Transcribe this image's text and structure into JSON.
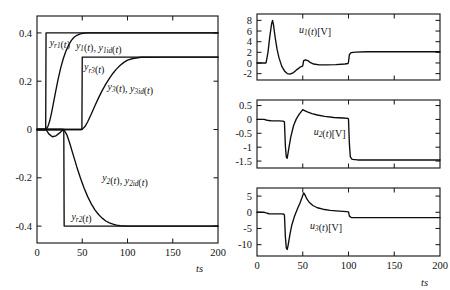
{
  "figure": {
    "name": "tracking-response-and-control-inputs",
    "background": "#ffffff",
    "curve_color": "#0d0d0d",
    "axis_color": "#1a1a1a"
  },
  "chart_data": [
    {
      "id": "outputs",
      "type": "line",
      "title": "",
      "xlabel": "t[s]",
      "ylabel": "",
      "xlim": [
        0,
        200
      ],
      "ylim": [
        -0.47,
        0.47
      ],
      "xticks": [
        0,
        50,
        100,
        150,
        200
      ],
      "xticklabels": [
        "0",
        "50",
        "100",
        "150",
        "200"
      ],
      "yticks": [
        0.4,
        0.2,
        0,
        -0.2,
        -0.4
      ],
      "yticklabels": [
        "0.4",
        "0.2",
        "0",
        "-0.2",
        "-0.4"
      ],
      "grid": false,
      "legend": "inline-annotations",
      "annotations": [
        {
          "id": "yr1-label",
          "text": "y_r1(t)",
          "x": 14,
          "y": 0.345
        },
        {
          "id": "y1-label",
          "text": "y_1(t), y_1id(t)",
          "x": 43,
          "y": 0.335
        },
        {
          "id": "yr3-label",
          "text": "y_r3(t)",
          "x": 52,
          "y": 0.245
        },
        {
          "id": "y3-label",
          "text": "y_3(t), y_3id(t)",
          "x": 78,
          "y": 0.165
        },
        {
          "id": "y2-label",
          "text": "y_2(t), y_2id(t)",
          "x": 72,
          "y": -0.215
        },
        {
          "id": "yr2-label",
          "text": "y_r2(t)",
          "x": 38,
          "y": -0.375
        }
      ],
      "series": [
        {
          "name": "y_r1(t)",
          "description": "reference step for output 1, rises to 0.4 at t=10",
          "x": [
            0,
            9.6,
            10.0,
            200
          ],
          "y": [
            0,
            0,
            0.4,
            0.4
          ]
        },
        {
          "name": "y_1(t), y_1id(t)",
          "description": "smooth first-order-like tracking of y_r1 reaching 0.4 near t=55",
          "x": [
            0,
            8,
            10,
            12,
            14,
            16,
            18,
            20,
            23,
            26,
            29,
            32,
            35,
            38,
            41,
            44,
            48,
            52,
            56,
            60,
            70,
            90,
            120,
            200
          ],
          "y": [
            0,
            0,
            0.002,
            0.012,
            0.035,
            0.068,
            0.106,
            0.145,
            0.202,
            0.252,
            0.293,
            0.325,
            0.35,
            0.369,
            0.382,
            0.39,
            0.396,
            0.399,
            0.4,
            0.4,
            0.4,
            0.4,
            0.4,
            0.4
          ]
        },
        {
          "name": "y_r3(t)",
          "description": "reference step for output 3, rises to 0.3 at t=50",
          "x": [
            0,
            49.6,
            50.0,
            200
          ],
          "y": [
            0,
            0,
            0.3,
            0.3
          ]
        },
        {
          "name": "y_3(t), y_3id(t)",
          "description": "smooth tracking of y_r3 reaching 0.3 near t=100",
          "x": [
            0,
            48,
            50,
            53,
            56,
            60,
            64,
            68,
            72,
            76,
            80,
            84,
            88,
            92,
            96,
            100,
            106,
            115,
            140,
            200
          ],
          "y": [
            0,
            0,
            0.001,
            0.012,
            0.032,
            0.064,
            0.098,
            0.131,
            0.161,
            0.188,
            0.212,
            0.233,
            0.251,
            0.266,
            0.278,
            0.287,
            0.294,
            0.299,
            0.3,
            0.3
          ]
        },
        {
          "name": "y_r2(t)",
          "description": "reference step for output 2, drops to -0.4 at t=30",
          "x": [
            0,
            29.6,
            30.0,
            200
          ],
          "y": [
            0,
            0,
            -0.4,
            -0.4
          ]
        },
        {
          "name": "y_2(t), y_2id(t)",
          "description": "smooth tracking of y_r2 reaching -0.4 near t=95",
          "x": [
            0,
            28,
            30,
            33,
            36,
            40,
            44,
            48,
            52,
            56,
            60,
            64,
            68,
            72,
            76,
            80,
            84,
            88,
            92,
            96,
            100,
            110,
            130,
            200
          ],
          "y": [
            0,
            0,
            -0.002,
            -0.022,
            -0.055,
            -0.105,
            -0.155,
            -0.201,
            -0.242,
            -0.278,
            -0.308,
            -0.333,
            -0.352,
            -0.367,
            -0.379,
            -0.387,
            -0.392,
            -0.396,
            -0.398,
            -0.399,
            -0.4,
            -0.4,
            -0.4,
            -0.4
          ]
        },
        {
          "name": "transient-dip-near-origin",
          "description": "small negative excursion of y_2 region between t=10 and t=30",
          "x": [
            0,
            10,
            13,
            17,
            21,
            25,
            28,
            30
          ],
          "y": [
            0,
            0,
            -0.018,
            -0.03,
            -0.026,
            -0.014,
            -0.004,
            0
          ]
        }
      ]
    },
    {
      "id": "u1",
      "type": "line",
      "title": "",
      "xlabel": "",
      "ylabel": "u_1(t)[V]",
      "xlim": [
        0,
        200
      ],
      "ylim": [
        -3.2,
        9.2
      ],
      "xticks": [
        0,
        50,
        100,
        150,
        200
      ],
      "xticklabels": [
        "",
        "",
        "",
        "",
        ""
      ],
      "yticks": [
        8,
        6,
        4,
        2,
        0,
        -2
      ],
      "yticklabels": [
        "8",
        "6",
        "4",
        "2",
        "0",
        "-2"
      ],
      "grid": false,
      "annotations": [
        {
          "id": "u1-label",
          "text": "u_1(t)[V]",
          "x": 46,
          "y": 5.6
        }
      ],
      "series": [
        {
          "name": "u_1(t)",
          "description": "control voltage 1: spike to 8 V at t=17, undershoot to -2.1, small bump at t=50, step to 2 V at t=100",
          "x": [
            0,
            9.5,
            10,
            12,
            14,
            16,
            17,
            18,
            20,
            22,
            24,
            27,
            30,
            33,
            36,
            40,
            44,
            47,
            49.5,
            50,
            51,
            53,
            56,
            58,
            62,
            68,
            76,
            86,
            96,
            99.5,
            100,
            101,
            103,
            108,
            120,
            150,
            200
          ],
          "y": [
            0,
            0,
            0.1,
            2.0,
            5.0,
            7.4,
            8.0,
            7.2,
            4.6,
            2.5,
            1.0,
            -0.6,
            -1.5,
            -2.0,
            -2.1,
            -1.8,
            -1.2,
            -0.8,
            -0.6,
            -0.55,
            0.45,
            0.6,
            0.4,
            0.1,
            -0.2,
            -0.35,
            -0.35,
            -0.3,
            -0.2,
            -0.1,
            0.2,
            1.6,
            1.95,
            2.05,
            2.1,
            2.1,
            2.1
          ]
        }
      ]
    },
    {
      "id": "u2",
      "type": "line",
      "title": "",
      "xlabel": "",
      "ylabel": "u_2(t)[V]",
      "xlim": [
        0,
        200
      ],
      "ylim": [
        -1.75,
        0.7
      ],
      "xticks": [
        0,
        50,
        100,
        150,
        200
      ],
      "xticklabels": [
        "",
        "",
        "",
        "",
        ""
      ],
      "yticks": [
        0.5,
        0,
        -0.5,
        -1,
        -1.5
      ],
      "yticklabels": [
        "0.5",
        "0",
        "-0.5",
        "-1",
        "-1.5"
      ],
      "grid": false,
      "annotations": [
        {
          "id": "u2-label",
          "text": "u_2(t)[V]",
          "x": 62,
          "y": -0.55
        }
      ],
      "series": [
        {
          "name": "u_2(t)",
          "description": "control voltage 2: mild bump near t=12, sharp dip to -1.4 at t=31, rise to +0.35 at t=50, decay, step down to -1.45 at t=100",
          "x": [
            0,
            8,
            10,
            13,
            16,
            20,
            24,
            28,
            29.5,
            30,
            31,
            32,
            33,
            35,
            37,
            40,
            43,
            46,
            49,
            50,
            52,
            55,
            60,
            66,
            74,
            84,
            94,
            99.5,
            100,
            101,
            102,
            104,
            110,
            130,
            160,
            200
          ],
          "y": [
            0,
            0,
            -0.02,
            -0.04,
            -0.05,
            -0.05,
            -0.05,
            -0.06,
            -0.07,
            -0.1,
            -0.95,
            -1.35,
            -1.4,
            -1.0,
            -0.62,
            -0.22,
            0.02,
            0.18,
            0.31,
            0.35,
            0.32,
            0.27,
            0.21,
            0.16,
            0.11,
            0.07,
            0.05,
            0.04,
            0.0,
            -0.9,
            -1.35,
            -1.44,
            -1.46,
            -1.46,
            -1.46,
            -1.46
          ]
        }
      ]
    },
    {
      "id": "u3",
      "type": "line",
      "title": "",
      "xlabel": "t[s]",
      "ylabel": "u_3(t)[V]",
      "xlim": [
        0,
        200
      ],
      "ylim": [
        -13.5,
        7.5
      ],
      "xticks": [
        0,
        50,
        100,
        150,
        200
      ],
      "xticklabels": [
        "0",
        "50",
        "100",
        "150",
        "200"
      ],
      "yticks": [
        5,
        0,
        -5,
        -10
      ],
      "yticklabels": [
        "5",
        "0",
        "-5",
        "-10"
      ],
      "grid": false,
      "annotations": [
        {
          "id": "u3-label",
          "text": "u_3(t)[V]",
          "x": 58,
          "y": -5.2
        }
      ],
      "series": [
        {
          "name": "u_3(t)",
          "description": "control voltage 3: small bump near t=12, deep dip to -11.5 at t=31, peak to +6 at t=51, decay toward 0, step down to -1.6 at t=100",
          "x": [
            0,
            8,
            10,
            13,
            17,
            22,
            27,
            29.5,
            30,
            31,
            32,
            33,
            34,
            36,
            38,
            41,
            44,
            47,
            49,
            50,
            51,
            52,
            54,
            57,
            61,
            66,
            72,
            80,
            90,
            98,
            99.5,
            100,
            101,
            103,
            110,
            130,
            160,
            200
          ],
          "y": [
            0,
            0,
            -0.2,
            -0.45,
            -0.5,
            -0.5,
            -0.5,
            -0.6,
            -0.9,
            -7.5,
            -11.0,
            -11.5,
            -10.2,
            -6.8,
            -4.0,
            -1.2,
            0.9,
            2.9,
            4.4,
            5.2,
            6.0,
            5.6,
            4.4,
            3.1,
            2.1,
            1.4,
            0.95,
            0.6,
            0.35,
            0.2,
            0.15,
            0.1,
            -1.2,
            -1.6,
            -1.65,
            -1.65,
            -1.65,
            -1.65
          ]
        }
      ]
    }
  ]
}
